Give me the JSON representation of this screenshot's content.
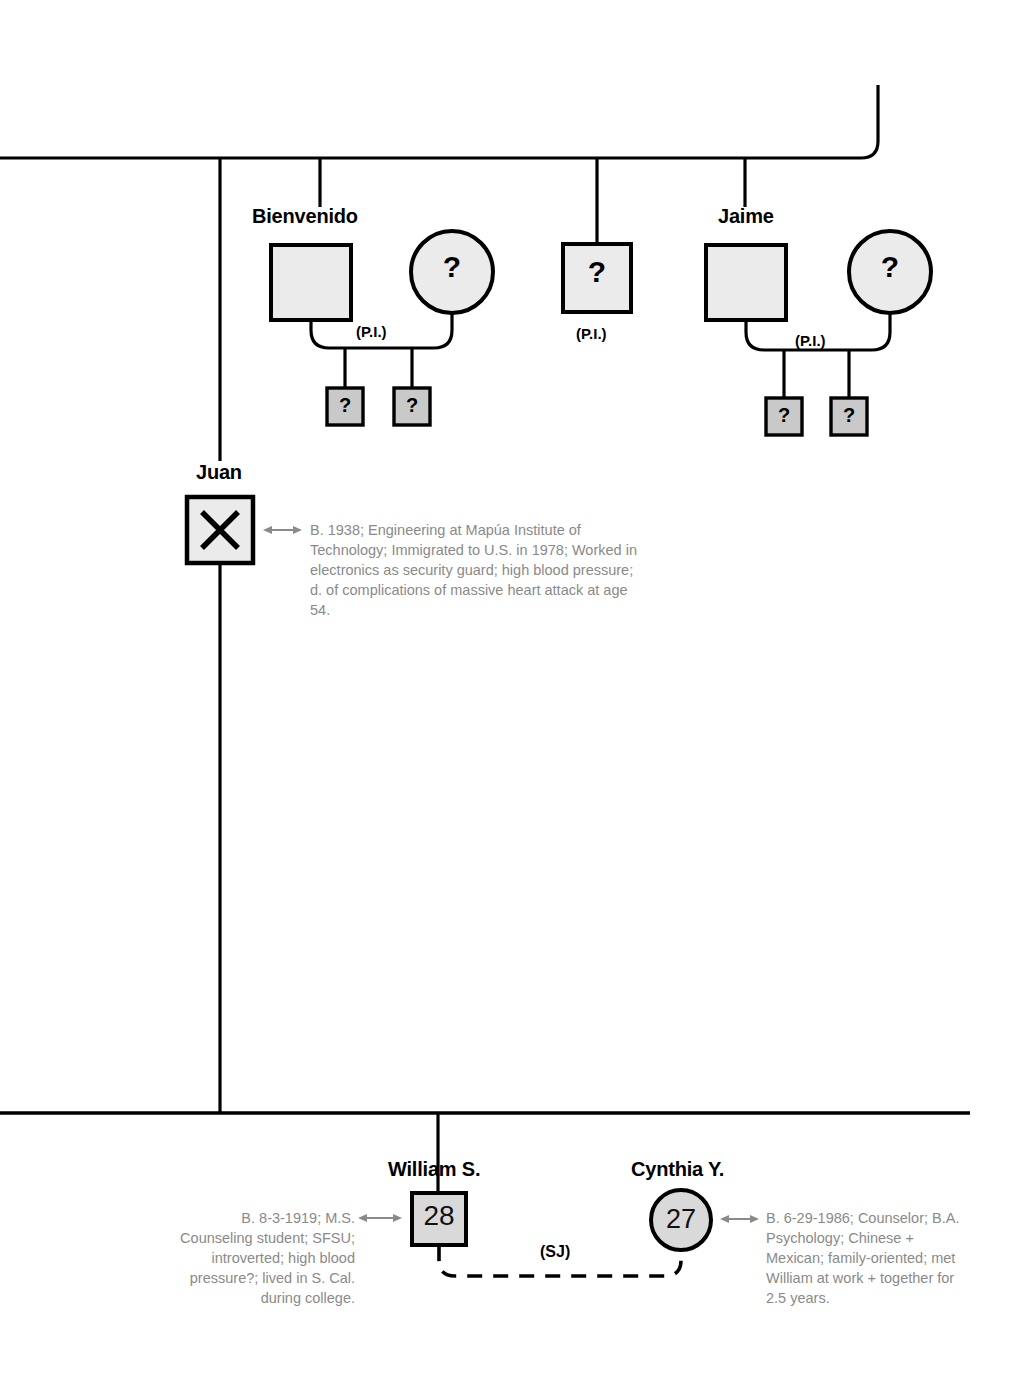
{
  "diagram": {
    "type": "genogram"
  },
  "persons": {
    "bienvenido": {
      "name": "Bienvenido",
      "symbol": "square",
      "glyph": ""
    },
    "bienvenido_spouse": {
      "name": "",
      "symbol": "circle",
      "glyph": "?"
    },
    "bienvenido_union_label": "(P.I.)",
    "bienvenido_child1": {
      "glyph": "?",
      "symbol": "square"
    },
    "bienvenido_child2": {
      "glyph": "?",
      "symbol": "square"
    },
    "middle_sibling": {
      "name": "",
      "symbol": "square",
      "glyph": "?",
      "label": "(P.I.)"
    },
    "jaime": {
      "name": "Jaime",
      "symbol": "square",
      "glyph": ""
    },
    "jaime_spouse": {
      "name": "",
      "symbol": "circle",
      "glyph": "?"
    },
    "jaime_union_label": "(P.I.)",
    "jaime_child1": {
      "glyph": "?",
      "symbol": "square"
    },
    "jaime_child2": {
      "glyph": "?",
      "symbol": "square"
    },
    "juan": {
      "name": "Juan",
      "symbol": "square",
      "glyph": "X",
      "annotation": "B. 1938; Engineering at Mapúa Institute of Technology; Immigrated to U.S. in 1978; Worked in electronics as security guard; high blood pressure; d. of complications of massive heart attack at age 54."
    },
    "william": {
      "name": "William S.",
      "symbol": "square",
      "glyph": "28",
      "annotation": "B. 8-3-1919; M.S. Counseling student; SFSU; introverted; high blood pressure?; lived in S. Cal. during college."
    },
    "cynthia": {
      "name": "Cynthia Y.",
      "symbol": "circle",
      "glyph": "27",
      "annotation": "B. 6-29-1986; Counselor; B.A. Psychology; Chinese + Mexican; family-oriented; met William at work + together for 2.5 years."
    },
    "william_cynthia_union_label": "(SJ)"
  },
  "colors": {
    "stroke": "#000000",
    "fill_light": "#ebebeb",
    "fill_mid": "#c9c9c9",
    "fill_person": "#d9d9d9",
    "annotation_text": "#8a8a8a",
    "background": "#ffffff"
  }
}
